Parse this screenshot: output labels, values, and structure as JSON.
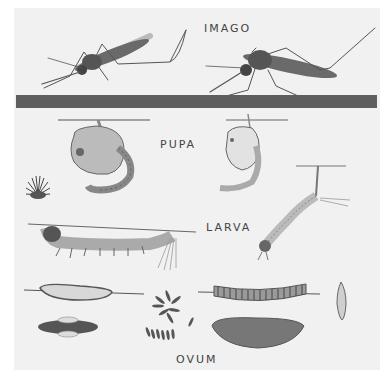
{
  "plate": {
    "background": "#f1f1f1",
    "ink": "#555555",
    "divider_color": "#5e5e5e"
  },
  "labels": {
    "imago": "IMAGO",
    "pupa": "PUPA",
    "larva": "LARVA",
    "ovum": "OVUM"
  }
}
